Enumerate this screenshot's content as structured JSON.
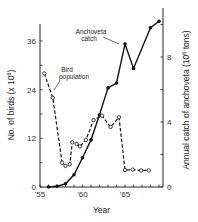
{
  "chart_data": {
    "type": "line",
    "title": "",
    "xlabel": "Year",
    "ylabel_left": "No. of birds (x 10^6)",
    "ylabel_right": "Annual catch of anchoveta (10^6 tons)",
    "x_ticks": [
      "'55",
      "'60",
      "'65"
    ],
    "xlim": [
      1955,
      1969.5
    ],
    "ylim_left": [
      0,
      39
    ],
    "ylim_right": [
      0,
      11
    ],
    "y_ticks_left": [
      "0",
      "12",
      "24",
      "36"
    ],
    "y_ticks_right": [
      "0",
      "4",
      "8"
    ],
    "grid": false,
    "series": [
      {
        "name": "Anchoveta catch",
        "axis": "right",
        "marker": "filled-circle",
        "line": "solid",
        "x": [
          1956,
          1957,
          1958,
          1959,
          1960,
          1961,
          1962,
          1963,
          1964,
          1965,
          1966,
          1968,
          1969
        ],
        "values": [
          0.0,
          0.05,
          0.2,
          0.75,
          1.8,
          2.9,
          4.45,
          6.1,
          6.4,
          8.8,
          7.3,
          9.8,
          10.2
        ]
      },
      {
        "name": "Bird population",
        "axis": "left",
        "marker": "open-circle",
        "line": "dashed",
        "x": [
          1955.5,
          1956.5,
          1957.6,
          1958.0,
          1958.5,
          1958.8,
          1959.3,
          1959.7,
          1960.4,
          1961.3,
          1962.3,
          1963.3,
          1964.3,
          1965.0,
          1965.9,
          1966.9,
          1967.8
        ],
        "values": [
          28,
          22,
          6,
          5.2,
          5.6,
          11,
          10.6,
          10,
          11.6,
          16.5,
          17.6,
          14.8,
          17.2,
          4.2,
          4.3,
          4.1,
          4.1
        ]
      }
    ],
    "annotations": [
      {
        "text_lines": [
          "Anchoveta",
          "catch"
        ],
        "points_to": "Anchoveta catch"
      },
      {
        "text_lines": [
          "Bird",
          "population"
        ],
        "points_to": "Bird population"
      }
    ]
  }
}
